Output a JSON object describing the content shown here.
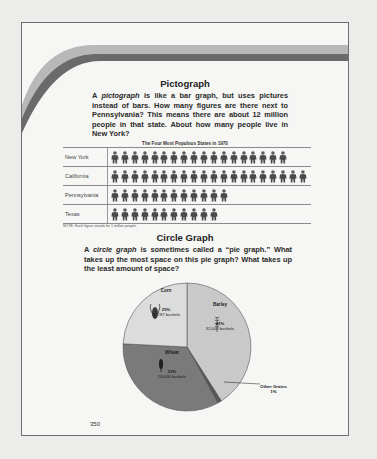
{
  "pictograph": {
    "heading": "Pictograph",
    "paragraph_parts": [
      "A ",
      "pictograph",
      " is like a bar graph, but uses pictures instead of bars. How many figures are there next to Pennsylvania? This means there are about 12 million people in that state. About how many people live in New York?"
    ],
    "chart_title": "The Four Most Populous States in 1970",
    "note": "NOTE: Each figure stands for 1 million people.",
    "rows": [
      {
        "label": "New York",
        "count": 18
      },
      {
        "label": "California",
        "count": 20
      },
      {
        "label": "Pennsylvania",
        "count": 12
      },
      {
        "label": "Texas",
        "count": 11
      }
    ],
    "icon": "person-figure-icon"
  },
  "circle_graph": {
    "heading": "Circle Graph",
    "paragraph_parts": [
      "A ",
      "circle graph",
      " is sometimes called a “pie graph.” What takes up the most space on this pie graph? What takes up the least amount of space?"
    ],
    "slices": [
      {
        "name": "Barley",
        "percent": "41%",
        "bushels": "32,004 bushels",
        "color": "#c9c9c9",
        "icon": "barley-icon"
      },
      {
        "name": "Other Grains",
        "percent": "1%",
        "bushels": "",
        "color": "#555555"
      },
      {
        "name": "Wheat",
        "percent": "33%",
        "bushels": "26,006 bushels",
        "color": "#7a7a7a",
        "icon": "wheat-icon"
      },
      {
        "name": "Corn",
        "percent": "25%",
        "bushels": "20,787 bushels",
        "color": "#dcdcdc",
        "icon": "corn-icon"
      }
    ]
  },
  "page_number": "350",
  "colors": {
    "frame": "#6e6e6e",
    "swoosh_light": "#b8b8b8",
    "swoosh_dark": "#6a6a6a",
    "page": "#f6f6f4"
  },
  "chart_data": [
    {
      "type": "table",
      "title": "The Four Most Populous States in 1970",
      "categories": [
        "New York",
        "California",
        "Pennsylvania",
        "Texas"
      ],
      "values": [
        18,
        20,
        12,
        11
      ],
      "unit": "million people (1 figure = 1 million people)",
      "note": "NOTE: Each figure stands for 1 million people."
    },
    {
      "type": "pie",
      "title": "",
      "categories": [
        "Barley",
        "Wheat",
        "Corn",
        "Other Grains"
      ],
      "values": [
        41,
        33,
        25,
        1
      ],
      "labels": [
        "41% 32,004 bushels",
        "33% 26,006 bushels",
        "25% 20,787 bushels",
        "1%"
      ]
    }
  ]
}
